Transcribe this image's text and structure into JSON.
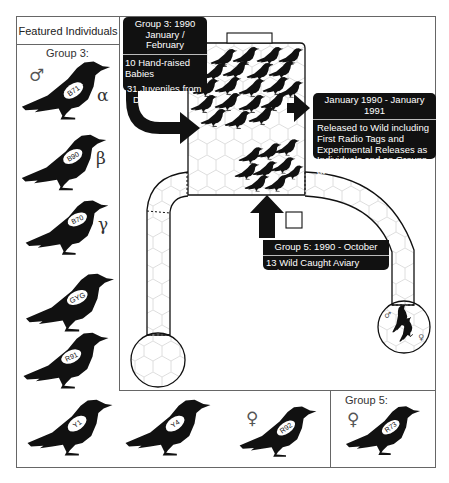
{
  "panel": {
    "title": "Featured Individuals",
    "group3_label": "Group 3:",
    "group5_label": "Group 5:"
  },
  "symbols": {
    "male": "♂",
    "female": "♀",
    "alpha": "α",
    "beta": "β",
    "gamma": "γ"
  },
  "birds": {
    "left_column": [
      {
        "tag": "B71",
        "rank": "α",
        "sex": "male"
      },
      {
        "tag": "B90",
        "rank": "β"
      },
      {
        "tag": "B70",
        "rank": "γ"
      },
      {
        "tag": "GYG"
      },
      {
        "tag": "R91"
      }
    ],
    "bottom_row": [
      {
        "tag": "Y1"
      },
      {
        "tag": "Y4"
      },
      {
        "tag": "R92",
        "sex": "female"
      }
    ],
    "group5": [
      {
        "tag": "R73",
        "sex": "female"
      }
    ]
  },
  "callouts": {
    "group3": {
      "header_line1": "Group 3:  1990",
      "header_line2": "January / February",
      "item1": "10 Hand-raised Babies",
      "item2_line1": "31 Juveniles from",
      "item2_line2": "Donkey Trap"
    },
    "release": {
      "header": "January 1990 - January 1991",
      "body": "Released to Wild including First Radio Tags and Experimental Releases as Individuals and as Groups at Foods"
    },
    "group5": {
      "header": "Group 5:  1990 - October",
      "body": "13 Wild Caught Aviary Vsitors"
    }
  },
  "colors": {
    "ink": "#111111",
    "border": "#666666",
    "hex_grid": "#d6d6d6"
  }
}
